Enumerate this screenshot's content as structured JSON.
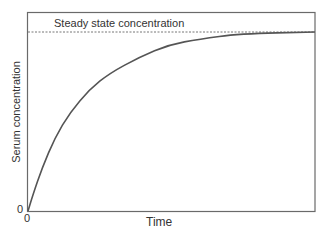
{
  "chart_data": {
    "type": "line",
    "title": "",
    "xlabel": "Time",
    "ylabel": "Serum concentration",
    "x_tick_labels": [
      "0"
    ],
    "y_tick_labels": [
      "0"
    ],
    "annotations": [
      {
        "text": "Steady state concentration",
        "type": "dashed horizontal line",
        "y": 1.0
      }
    ],
    "grid": false,
    "legend": null,
    "xlim": [
      0,
      1
    ],
    "ylim": [
      0,
      1.1
    ],
    "series": [
      {
        "name": "Serum concentration",
        "x": [
          0,
          0.017,
          0.049,
          0.094,
          0.146,
          0.215,
          0.285,
          0.389,
          0.493,
          0.597,
          0.736,
          1.0
        ],
        "y": [
          0,
          0.09,
          0.24,
          0.41,
          0.55,
          0.68,
          0.77,
          0.86,
          0.93,
          0.96,
          0.99,
          1.0
        ]
      }
    ],
    "colors": {
      "curve": "#555555",
      "axes": "#555555",
      "steady_line": "#666666"
    }
  },
  "labels": {
    "steady_state": "Steady state concentration",
    "x_axis": "Time",
    "y_axis": "Serum concentration",
    "x_zero": "0",
    "y_zero": "0"
  }
}
